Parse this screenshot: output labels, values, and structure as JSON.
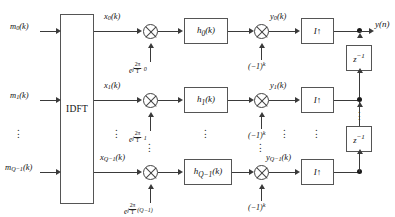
{
  "diagram": {
    "idft": {
      "label": "IDFT"
    },
    "output": {
      "label": "y(n)"
    },
    "ellipsis": "⋮",
    "rows": [
      {
        "input_label": "m",
        "input_sub": "0",
        "input_suffix": "(k)",
        "x_label": "x",
        "x_sub": "0",
        "x_suffix": "(k)",
        "exp_base": "e",
        "exp_j": "j",
        "exp_num": "2π",
        "exp_den": "T",
        "exp_tail": "· 0",
        "filter": "h",
        "filter_sub": "0",
        "filter_suffix": "(k)",
        "sign_label": "(−1)",
        "sign_sup": "k",
        "y_label": "y",
        "y_sub": "0",
        "y_suffix": "(k)",
        "interp": "I↑"
      },
      {
        "input_label": "m",
        "input_sub": "1",
        "input_suffix": "(k)",
        "x_label": "x",
        "x_sub": "1",
        "x_suffix": "(k)",
        "exp_base": "e",
        "exp_j": "j",
        "exp_num": "2π",
        "exp_den": "T",
        "exp_tail": "· 1",
        "filter": "h",
        "filter_sub": "1",
        "filter_suffix": "(k)",
        "sign_label": "(−1)",
        "sign_sup": "k",
        "y_label": "y",
        "y_sub": "1",
        "y_suffix": "(k)",
        "interp": "I↑"
      },
      {
        "input_label": "m",
        "input_sub": "Q−1",
        "input_suffix": "(k)",
        "x_label": "x",
        "x_sub": "Q−1",
        "x_suffix": "(k)",
        "exp_base": "e",
        "exp_j": "j",
        "exp_num": "2π",
        "exp_den": "T",
        "exp_tail": "·(Q−1)",
        "filter": "h",
        "filter_sub": "Q−1",
        "filter_suffix": "(k)",
        "sign_label": "(−1)",
        "sign_sup": "k",
        "y_label": "y",
        "y_sub": "Q−1",
        "y_suffix": "(k)",
        "interp": "I↑"
      }
    ],
    "delays": [
      {
        "label": "z",
        "sup": "−1"
      },
      {
        "label": "z",
        "sup": "−1"
      }
    ],
    "colors": {
      "line": "#3a3a3a",
      "text": "#111111",
      "box_border": "#555555"
    }
  }
}
